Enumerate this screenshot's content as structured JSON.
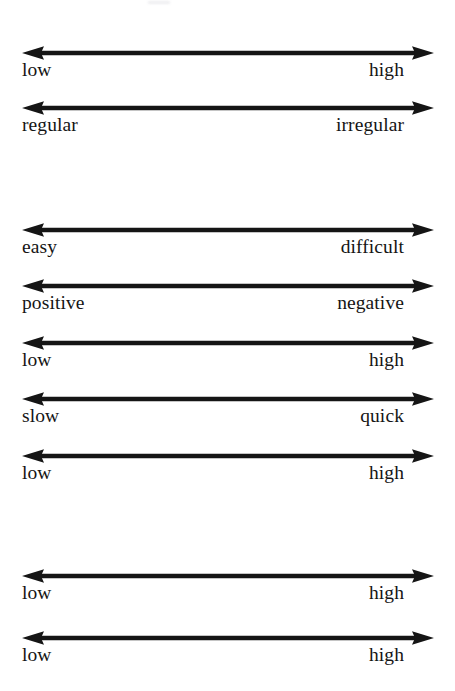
{
  "page": {
    "background_color": "#ffffff",
    "ink_color": "#151515",
    "artifact": "scan-speck"
  },
  "axis": {
    "style": "double-headed-arrow",
    "line_color": "#151515",
    "left_arrow_direction": "left",
    "right_arrow_direction": "right"
  },
  "scales": [
    {
      "left_label": "low",
      "right_label": "high",
      "top": 44,
      "group": 1
    },
    {
      "left_label": "regular",
      "right_label": "irregular",
      "top": 99,
      "group": 1
    },
    {
      "left_label": "easy",
      "right_label": "difficult",
      "top": 221,
      "group": 2
    },
    {
      "left_label": "positive",
      "right_label": "negative",
      "top": 277,
      "group": 2
    },
    {
      "left_label": "low",
      "right_label": "high",
      "top": 334,
      "group": 2
    },
    {
      "left_label": "slow",
      "right_label": "quick",
      "top": 390,
      "group": 2
    },
    {
      "left_label": "low",
      "right_label": "high",
      "top": 447,
      "group": 2
    },
    {
      "left_label": "low",
      "right_label": "high",
      "top": 567,
      "group": 3
    },
    {
      "left_label": "low",
      "right_label": "high",
      "top": 629,
      "group": 3
    }
  ]
}
